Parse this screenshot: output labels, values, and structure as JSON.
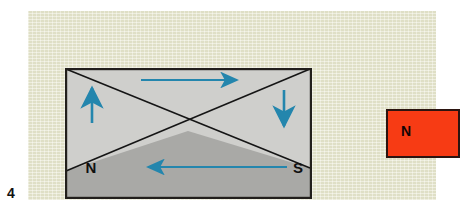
{
  "figure": {
    "number": "4",
    "background_color": "#e7e7cd",
    "page_color": "#ffffff"
  },
  "magnet_diagram": {
    "name": "horseshoe-field-diagram",
    "fill_light": "#cfcfcc",
    "fill_dark": "#a9a9a6",
    "border_color": "#221f1c",
    "line_color": "#151515",
    "arrow_color": "#2486ad",
    "labels": {
      "north": "N",
      "south": "S"
    },
    "arrows": [
      {
        "name": "top-field-arrow",
        "direction": "right",
        "x1": 76,
        "y1": 12,
        "x2": 176,
        "y2": 12
      },
      {
        "name": "left-field-arrow",
        "direction": "up",
        "x1": 27,
        "y1": 55,
        "x2": 27,
        "y2": 16
      },
      {
        "name": "right-field-arrow",
        "direction": "down",
        "x1": 219,
        "y1": 22,
        "x2": 219,
        "y2": 62
      },
      {
        "name": "bottom-field-arrow",
        "direction": "left",
        "x1": 222,
        "y1": 99,
        "x2": 79,
        "y2": 99
      }
    ]
  },
  "bar_magnet": {
    "name": "red-bar-magnet",
    "pole_label": "N",
    "fill_color": "#f73b14",
    "border_color": "#2b1410"
  }
}
